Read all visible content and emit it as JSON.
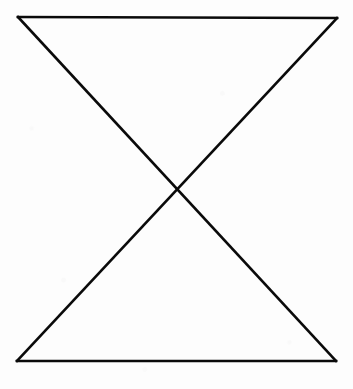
{
  "figure": {
    "name": "hourglass-bowtie-figure",
    "background_color": "#fdfdfd",
    "stroke_color": "#0a0a0a",
    "stroke_width": 2.6,
    "canvas": {
      "width": 353,
      "height": 389
    },
    "vertices": {
      "top_left": {
        "label": "top-left",
        "x": 18,
        "y": 17
      },
      "top_right": {
        "label": "top-right",
        "x": 337,
        "y": 18
      },
      "bottom_left": {
        "label": "bottom-left",
        "x": 17,
        "y": 361
      },
      "bottom_right": {
        "label": "bottom-right",
        "x": 336,
        "y": 361
      },
      "crossing": {
        "label": "crossing-apex",
        "x": 176,
        "y": 189
      }
    },
    "segments": [
      {
        "name": "top-edge",
        "from": "top_left",
        "to": "top_right",
        "path": "M 18 17 L 337 18"
      },
      {
        "name": "bottom-edge",
        "from": "bottom_left",
        "to": "bottom_right",
        "path": "M 17 361 L 336 361"
      },
      {
        "name": "diagonal-tl-br",
        "from": "top_left",
        "to": "bottom_right",
        "path": "M 18 17 L 336 361"
      },
      {
        "name": "diagonal-tr-bl",
        "from": "top_right",
        "to": "bottom_left",
        "path": "M 337 18 L 17 361"
      }
    ],
    "triangles": [
      {
        "name": "upper-triangle",
        "points": "18,17 337,18 176,189"
      },
      {
        "name": "lower-triangle",
        "points": "176,189 336,361 17,361"
      }
    ]
  }
}
